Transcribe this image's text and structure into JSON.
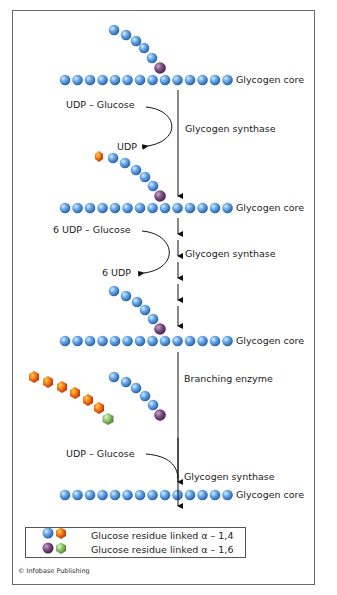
{
  "figure": {
    "credit": "© Infobase Publishing"
  },
  "labels": {
    "core_1": "Glycogen core",
    "core_2": "Glycogen core",
    "core_3": "Glycogen core",
    "core_4": "Glycogen core",
    "step1_substrate": "UDP – Glucose",
    "step1_enzyme": "Glycogen synthase",
    "step1_product": "UDP",
    "step2_substrate": "6 UDP – Glucose",
    "step2_enzyme": "Glycogen synthase",
    "step2_product": "6 UDP",
    "step3_enzyme": "Branching enzyme",
    "step4_substrate": "UDP – Glucose",
    "step4_enzyme": "Glycogen synthase"
  },
  "legend": {
    "items": [
      {
        "label": "Glucose residue linked α – 1,4",
        "colors": [
          "#4f8fd6",
          "#f07a1a"
        ]
      },
      {
        "label": "Glucose residue linked α – 1,6",
        "colors": [
          "#7a4a7e",
          "#8cc46a"
        ]
      }
    ]
  },
  "colors": {
    "blue_residue": "#5b9ae0",
    "orange_residue": "#f07a1a",
    "purple_residue": "#7a4a7e",
    "green_residue": "#8cc46a",
    "arrow": "#111111"
  }
}
